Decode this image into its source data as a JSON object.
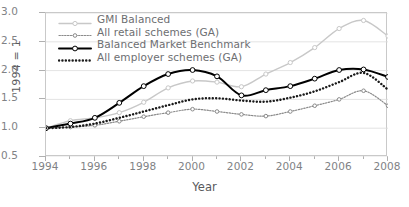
{
  "chart_data": {
    "type": "line",
    "title": "",
    "xlabel": "Year",
    "ylabel": "1994 = 1",
    "xlim": [
      1994,
      2008
    ],
    "ylim": [
      0.5,
      3.0
    ],
    "ytick_labels": [
      "3.0",
      "2.5",
      "2.0",
      "1.5",
      "1.0",
      "0.5"
    ],
    "ytick_values": [
      3.0,
      2.5,
      2.0,
      1.5,
      1.0,
      0.5
    ],
    "xtick_labels": [
      "1994",
      "1996",
      "1998",
      "2000",
      "2002",
      "2004",
      "2006",
      "2008"
    ],
    "xtick_values": [
      1994,
      1996,
      1998,
      2000,
      2002,
      2004,
      2006,
      2008
    ],
    "xtick_minor_values": [
      1995,
      1997,
      1999,
      2001,
      2003,
      2005,
      2007
    ],
    "grid": "horizontal",
    "legend_position": "top-left",
    "x": [
      1994,
      1995,
      1996,
      1997,
      1998,
      1999,
      2000,
      2001,
      2002,
      2003,
      2004,
      2005,
      2006,
      2007,
      2008
    ],
    "series": [
      {
        "name": "GMI Balanced",
        "color": "#c8c8c8",
        "style": "solid-marker",
        "values": [
          1.0,
          1.13,
          1.18,
          1.27,
          1.45,
          1.7,
          1.82,
          1.8,
          1.72,
          1.94,
          2.14,
          2.4,
          2.73,
          2.87,
          2.6
        ]
      },
      {
        "name": "All retail schemes (GA)",
        "color": "#8a8a8a",
        "style": "fine-dotted-marker",
        "values": [
          1.0,
          1.02,
          1.05,
          1.12,
          1.2,
          1.27,
          1.33,
          1.29,
          1.24,
          1.21,
          1.29,
          1.39,
          1.5,
          1.65,
          1.39
        ]
      },
      {
        "name": "Balanced Market Benchmark",
        "color": "#000000",
        "style": "solid-thick-marker",
        "values": [
          1.0,
          1.08,
          1.18,
          1.44,
          1.73,
          1.94,
          2.01,
          1.9,
          1.57,
          1.66,
          1.73,
          1.86,
          2.01,
          2.02,
          1.89
        ]
      },
      {
        "name": "All employer schemes (GA)",
        "color": "#1a1a1a",
        "style": "bold-dotted",
        "values": [
          1.0,
          1.02,
          1.08,
          1.18,
          1.29,
          1.4,
          1.5,
          1.52,
          1.48,
          1.46,
          1.53,
          1.64,
          1.8,
          1.96,
          1.67
        ]
      }
    ]
  },
  "axis": {
    "y_title": "1994 = 1",
    "x_title": "Year"
  }
}
